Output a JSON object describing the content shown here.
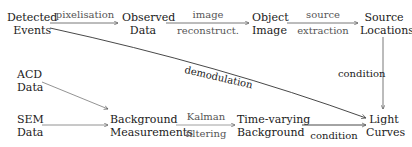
{
  "nodes": {
    "detected_events": [
      "Detected",
      "Events"
    ],
    "observed_data": [
      "Observed",
      "Data"
    ],
    "object_image": [
      "Object",
      "Image"
    ],
    "source_locations": [
      "Source",
      "Locations"
    ],
    "acd_data": [
      "ACD",
      "Data"
    ],
    "sem_data": [
      "SEM",
      "Data"
    ],
    "background_measurements": [
      "Background",
      "Measurements"
    ],
    "time_varying_background": [
      "Time-varying",
      "Background"
    ],
    "light_curves": [
      "Light",
      "Curves"
    ]
  },
  "edges": {
    "pixelisation": "pixelisation",
    "image_reconstruct": [
      "image",
      "reconstruct."
    ],
    "source_extraction": [
      "source",
      "extraction"
    ],
    "demodulation": "demodulation",
    "condition_vertical": "condition",
    "kalman_filtering": [
      "Kalman",
      "filtering"
    ],
    "condition_bottom": "condition"
  },
  "colors": {
    "text": "#1a1a1a",
    "edge_label": "#555555",
    "arrow": "#444444"
  }
}
